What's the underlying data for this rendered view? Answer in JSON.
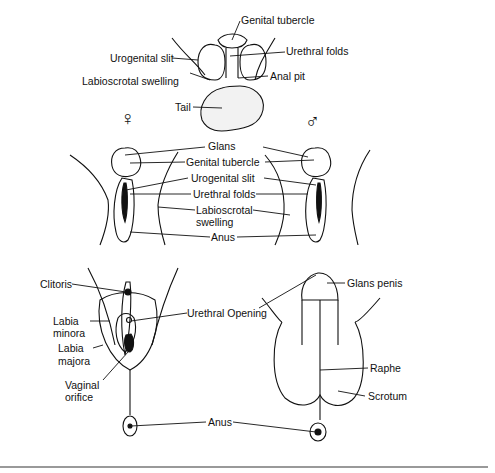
{
  "diagram": {
    "top_stage": {
      "labels": {
        "genital_tubercle": "Genital tubercle",
        "urogenital_slit": "Urogenital slit",
        "urethral_folds": "Urethral folds",
        "labioscrotal_swelling": "Labioscrotal swelling",
        "anal_pit": "Anal pit",
        "tail": "Tail"
      }
    },
    "middle_stage": {
      "female_symbol": "♀",
      "male_symbol": "♂",
      "labels": {
        "glans": "Glans",
        "genital_tubercle": "Genital tubercle",
        "urogenital_slit": "Urogenital slit",
        "urethral_folds": "Urethral folds",
        "labioscrotal_line1": "Labioscrotal",
        "labioscrotal_line2": "swelling",
        "anus": "Anus"
      }
    },
    "bottom_stage": {
      "female_labels": {
        "clitoris": "Clitoris",
        "labia_minora_line1": "Labia",
        "labia_minora_line2": "minora",
        "labia_majora_line1": "Labia",
        "labia_majora_line2": "majora",
        "vaginal_line1": "Vaginal",
        "vaginal_line2": "orifice"
      },
      "shared_labels": {
        "urethral_opening": "Urethral Opening",
        "anus": "Anus"
      },
      "male_labels": {
        "glans_penis": "Glans penis",
        "raphe": "Raphe",
        "scrotum": "Scrotum"
      }
    }
  }
}
